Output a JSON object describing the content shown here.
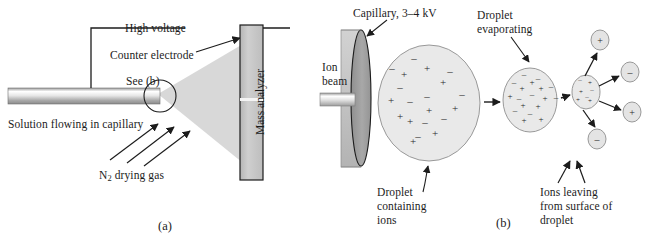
{
  "figure": {
    "background": "#ffffff",
    "panels": [
      {
        "tag": "(a)",
        "name": "electrospray-source"
      },
      {
        "tag": "(b)",
        "name": "droplet-desolvation"
      }
    ]
  },
  "panel_a": {
    "tag": "(a)",
    "labels": {
      "high_voltage": "High voltage",
      "counter_electrode": "Counter electrode",
      "see_b": "See (b)",
      "solution": "Solution flowing in capillary",
      "drying_gas_pre": "N",
      "drying_gas_sub": "2",
      "drying_gas_post": " drying gas",
      "mass_analyzer": "Mass analyzer"
    },
    "colors": {
      "tube_dark": "#8e8e8e",
      "tube_light": "#f2f2f2",
      "spray": "#d3d3d3",
      "analyzer_fill": "#c9c9c9",
      "stroke": "#1c1c1c"
    },
    "gas_arrow_count": 3
  },
  "panel_b": {
    "tag": "(b)",
    "labels": {
      "capillary": "Capillary, 3–4 kV",
      "ion_beam": "Ion\nbeam",
      "droplet_evaporating": "Droplet\nevaporating",
      "droplet_containing_ions": "Droplet\ncontaining\nions",
      "ions_leaving": "Ions leaving\nfrom surface of\ndroplet"
    },
    "colors": {
      "disc_face": "#9d9d9d",
      "disc_body": "#c4c4c4",
      "droplet_fill": "#e9e9e9",
      "droplet_stroke": "#8a8a8a",
      "ion_fill": "#e2e2e2",
      "stroke": "#1c1c1c"
    },
    "droplet_large": {
      "cx": 429,
      "cy": 103,
      "rx": 51,
      "ry": 58,
      "charges": [
        {
          "s": "-",
          "x": 414,
          "y": 58
        },
        {
          "s": "-",
          "x": 392,
          "y": 68
        },
        {
          "s": "+",
          "x": 427,
          "y": 68
        },
        {
          "s": "-",
          "x": 450,
          "y": 71
        },
        {
          "s": "+",
          "x": 404,
          "y": 74
        },
        {
          "s": "+",
          "x": 443,
          "y": 82
        },
        {
          "s": "-",
          "x": 400,
          "y": 87
        },
        {
          "s": "-",
          "x": 427,
          "y": 96
        },
        {
          "s": "-",
          "x": 462,
          "y": 94
        },
        {
          "s": "+",
          "x": 391,
          "y": 100
        },
        {
          "s": "-",
          "x": 410,
          "y": 101
        },
        {
          "s": "+",
          "x": 429,
          "y": 110
        },
        {
          "s": "+",
          "x": 455,
          "y": 108
        },
        {
          "s": "+",
          "x": 400,
          "y": 116
        },
        {
          "s": "+",
          "x": 410,
          "y": 121
        },
        {
          "s": "-",
          "x": 425,
          "y": 122
        },
        {
          "s": "-",
          "x": 444,
          "y": 118
        },
        {
          "s": "+",
          "x": 435,
          "y": 133
        },
        {
          "s": "-",
          "x": 418,
          "y": 136
        },
        {
          "s": "+",
          "x": 413,
          "y": 141
        }
      ]
    },
    "droplet_medium": {
      "cx": 530,
      "cy": 100,
      "rx": 27,
      "ry": 32,
      "charges": [
        {
          "s": "-",
          "x": 524,
          "y": 74
        },
        {
          "s": "-",
          "x": 538,
          "y": 78
        },
        {
          "s": "+",
          "x": 532,
          "y": 82
        },
        {
          "s": "-",
          "x": 514,
          "y": 82
        },
        {
          "s": "+",
          "x": 522,
          "y": 88
        },
        {
          "s": "+",
          "x": 541,
          "y": 88
        },
        {
          "s": "-",
          "x": 551,
          "y": 86
        },
        {
          "s": "-",
          "x": 532,
          "y": 94
        },
        {
          "s": "+",
          "x": 510,
          "y": 96
        },
        {
          "s": "-",
          "x": 519,
          "y": 98
        },
        {
          "s": "+",
          "x": 545,
          "y": 98
        },
        {
          "s": "-",
          "x": 556,
          "y": 97
        },
        {
          "s": "+",
          "x": 523,
          "y": 105
        },
        {
          "s": "+",
          "x": 538,
          "y": 106
        },
        {
          "s": "-",
          "x": 515,
          "y": 110
        },
        {
          "s": "-",
          "x": 530,
          "y": 113
        },
        {
          "s": "+",
          "x": 524,
          "y": 120
        },
        {
          "s": "+",
          "x": 541,
          "y": 119
        }
      ]
    },
    "droplet_small": {
      "cx": 586,
      "cy": 92,
      "rx": 14,
      "ry": 17,
      "charges": [
        {
          "s": "-",
          "x": 580,
          "y": 80
        },
        {
          "s": "+",
          "x": 590,
          "y": 83
        },
        {
          "s": "-",
          "x": 592,
          "y": 90
        },
        {
          "s": "+",
          "x": 581,
          "y": 92
        },
        {
          "s": "-",
          "x": 587,
          "y": 97
        },
        {
          "s": "+",
          "x": 578,
          "y": 100
        },
        {
          "s": "+",
          "x": 590,
          "y": 101
        }
      ]
    },
    "free_ions": [
      {
        "s": "+",
        "cx": 600,
        "cy": 40,
        "rx": 9,
        "ry": 10,
        "name": "free-ion-positive-top"
      },
      {
        "s": "-",
        "cx": 630,
        "cy": 72,
        "rx": 9,
        "ry": 10,
        "name": "free-ion-negative-right"
      },
      {
        "s": "+",
        "cx": 632,
        "cy": 112,
        "rx": 9,
        "ry": 10,
        "name": "free-ion-positive-right"
      },
      {
        "s": "-",
        "cx": 597,
        "cy": 139,
        "rx": 9,
        "ry": 10,
        "name": "free-ion-negative-bottom"
      }
    ]
  }
}
